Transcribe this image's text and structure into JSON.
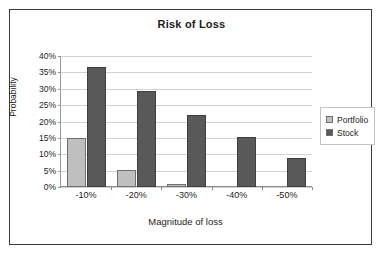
{
  "chart_data": {
    "type": "bar",
    "title": "Risk of Loss",
    "xlabel": "Magnitude of loss",
    "ylabel": "Probability",
    "categories": [
      "-10%",
      "-20%",
      "-30%",
      "-40%",
      "-50%"
    ],
    "series": [
      {
        "name": "Portfolio",
        "color": "#bfbfbf",
        "values": [
          15,
          5.2,
          1,
          0,
          0
        ]
      },
      {
        "name": "Stock",
        "color": "#595959",
        "values": [
          36.5,
          29.3,
          22.1,
          15.2,
          9
        ]
      }
    ],
    "ylim": [
      0,
      40
    ],
    "yticks": [
      0,
      5,
      10,
      15,
      20,
      25,
      30,
      35,
      40
    ],
    "ytick_labels": [
      "0%",
      "5%",
      "10%",
      "15%",
      "20%",
      "25%",
      "30%",
      "35%",
      "40%"
    ],
    "grid": true,
    "legend_position": "right",
    "legend_entries": [
      "Portfolio",
      "Stock"
    ]
  }
}
